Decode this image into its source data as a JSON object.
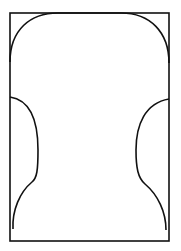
{
  "diagram": {
    "type": "outline-drawing",
    "colors": {
      "background": "#ffffff",
      "stroke": "#111111"
    },
    "frame": {
      "x": 10,
      "y": 13,
      "width": 159,
      "height": 228
    },
    "paths": {
      "upper_arch": "M10 62 C10 30 30 13 58 13 L121 13 C150 13 169 32 169 63",
      "left_lower": "M10 97 C30 100 38 120 38 150 C38 170 37 178 32 182 C20 192 12 210 13 229",
      "right_lower": "M169 99 C145 103 136 125 136 150 C136 168 138 178 145 184 C158 195 166 212 166 230"
    }
  }
}
